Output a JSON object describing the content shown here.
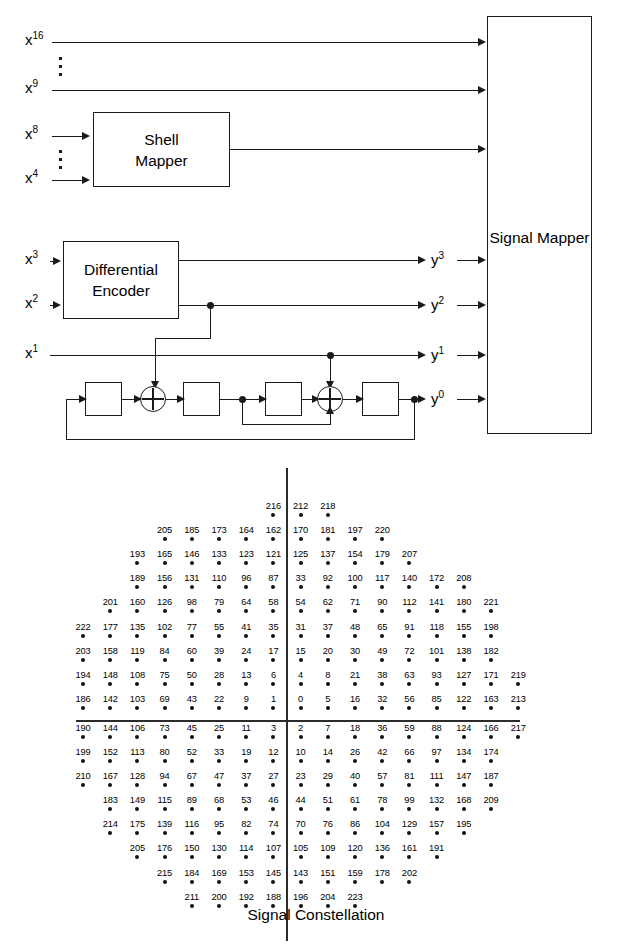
{
  "block_diagram": {
    "blocks": [
      {
        "name": "shell-mapper",
        "label": "Shell\nMapper",
        "line1": "Shell",
        "line2": "Mapper"
      },
      {
        "name": "differential-encoder",
        "label": "Differential\nEncoder",
        "line1": "Differential",
        "line2": "Encoder"
      },
      {
        "name": "signal-mapper",
        "label": "Signal Mapper",
        "line1": "Signal Mapper",
        "line2": ""
      }
    ],
    "shell_mapper_line1": "Shell",
    "shell_mapper_line2": "Mapper",
    "diff_encoder_line1": "Differential",
    "diff_encoder_line2": "Encoder",
    "signal_mapper_label": "Signal Mapper",
    "inputs": [
      {
        "base": "x",
        "sup": "16"
      },
      {
        "base": "x",
        "sup": "9"
      },
      {
        "base": "x",
        "sup": "8"
      },
      {
        "base": "x",
        "sup": "4"
      },
      {
        "base": "x",
        "sup": "3"
      },
      {
        "base": "x",
        "sup": "2"
      },
      {
        "base": "x",
        "sup": "1"
      }
    ],
    "outputs": [
      {
        "base": "y",
        "sup": "3"
      },
      {
        "base": "y",
        "sup": "2"
      },
      {
        "base": "y",
        "sup": "1"
      },
      {
        "base": "y",
        "sup": "0"
      }
    ],
    "delay_count": 4,
    "xor_count": 2
  },
  "caption": "Signal Constellation",
  "chart_data": {
    "type": "scatter",
    "title": "Signal Constellation",
    "xlabel": "",
    "ylabel": "",
    "grid": false,
    "legend": null,
    "axes": {
      "x_axis": true,
      "y_axis": true,
      "x_zero_col": 8,
      "y_zero_row": 11
    },
    "col_count": 18,
    "row_count": 18,
    "note": "Each point is a 224-point constellation label placed on a rectangular lattice; row index 0 is topmost, column index 0 is leftmost. The vertical axis lies between column 7 and column 8; the horizontal axis lies between row 10 and row 11.",
    "rows": [
      {
        "row": 0,
        "cells": [
          null,
          null,
          null,
          null,
          null,
          null,
          null,
          "216",
          "212",
          "218",
          null,
          null,
          null,
          null,
          null,
          null,
          null,
          null
        ]
      },
      {
        "row": 1,
        "cells": [
          null,
          null,
          null,
          "205",
          "185",
          "173",
          "164",
          "162",
          "170",
          "181",
          "197",
          "220",
          null,
          null,
          null,
          null,
          null,
          null
        ]
      },
      {
        "row": 2,
        "cells": [
          null,
          null,
          "193",
          "165",
          "146",
          "133",
          "123",
          "121",
          "125",
          "137",
          "154",
          "179",
          "207",
          null,
          null,
          null,
          null,
          null
        ]
      },
      {
        "row": 3,
        "cells": [
          null,
          null,
          "189",
          "156",
          "131",
          "110",
          "96",
          "87",
          "33",
          "92",
          "100",
          "117",
          "140",
          "172",
          "208",
          null,
          null,
          null
        ]
      },
      {
        "row": 4,
        "cells": [
          null,
          "201",
          "160",
          "126",
          "98",
          "79",
          "64",
          "58",
          "54",
          "62",
          "71",
          "90",
          "112",
          "141",
          "180",
          "221",
          null,
          null
        ]
      },
      {
        "row": 5,
        "cells": [
          "222",
          "177",
          "135",
          "102",
          "77",
          "55",
          "41",
          "35",
          "31",
          "37",
          "48",
          "65",
          "91",
          "118",
          "155",
          "198",
          null,
          null
        ]
      },
      {
        "row": 6,
        "cells": [
          "203",
          "158",
          "119",
          "84",
          "60",
          "39",
          "24",
          "17",
          "15",
          "20",
          "30",
          "49",
          "72",
          "101",
          "138",
          "182",
          null,
          null
        ]
      },
      {
        "row": 7,
        "cells": [
          "194",
          "148",
          "108",
          "75",
          "50",
          "28",
          "13",
          "6",
          "4",
          "8",
          "21",
          "38",
          "63",
          "93",
          "127",
          "171",
          "219",
          null
        ]
      },
      {
        "row": 8,
        "cells": [
          "186",
          "142",
          "103",
          "69",
          "43",
          "22",
          "9",
          "1",
          "0",
          "5",
          "16",
          "32",
          "56",
          "85",
          "122",
          "163",
          "213",
          null
        ]
      },
      {
        "row": 9,
        "cells": [
          "190",
          "144",
          "106",
          "73",
          "45",
          "25",
          "11",
          "3",
          "2",
          "7",
          "18",
          "36",
          "59",
          "88",
          "124",
          "166",
          "217",
          null
        ]
      },
      {
        "row": 10,
        "cells": [
          "199",
          "152",
          "113",
          "80",
          "52",
          "33",
          "19",
          "12",
          "10",
          "14",
          "26",
          "42",
          "66",
          "97",
          "134",
          "174",
          null,
          null
        ]
      },
      {
        "row": 11,
        "cells": [
          "210",
          "167",
          "128",
          "94",
          "67",
          "47",
          "37",
          "27",
          "23",
          "29",
          "40",
          "57",
          "81",
          "111",
          "147",
          "187",
          null,
          null
        ]
      },
      {
        "row": 12,
        "cells": [
          null,
          "183",
          "149",
          "115",
          "89",
          "68",
          "53",
          "46",
          "44",
          "51",
          "61",
          "78",
          "99",
          "132",
          "168",
          "209",
          null,
          null
        ]
      },
      {
        "row": 13,
        "cells": [
          null,
          "214",
          "175",
          "139",
          "116",
          "95",
          "82",
          "74",
          "70",
          "76",
          "86",
          "104",
          "129",
          "157",
          "195",
          null,
          null,
          null
        ]
      },
      {
        "row": 14,
        "cells": [
          null,
          null,
          "205",
          "176",
          "150",
          "130",
          "114",
          "107",
          "105",
          "109",
          "120",
          "136",
          "161",
          "191",
          null,
          null,
          null,
          null
        ]
      },
      {
        "row": 15,
        "cells": [
          null,
          null,
          null,
          "215",
          "184",
          "169",
          "153",
          "145",
          "143",
          "151",
          "159",
          "178",
          "202",
          null,
          null,
          null,
          null,
          null
        ]
      },
      {
        "row": 16,
        "cells": [
          null,
          null,
          null,
          null,
          "211",
          "200",
          "192",
          "188",
          "196",
          "204",
          "223",
          null,
          null,
          null,
          null,
          null,
          null,
          null
        ]
      }
    ]
  }
}
